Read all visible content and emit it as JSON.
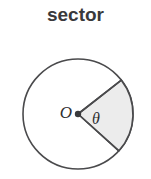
{
  "figure": {
    "title": "sector",
    "type": "geometry-diagram",
    "background_color": "#ffffff",
    "title_color": "#39393b"
  },
  "circle": {
    "center_label": "O",
    "center_x": 78,
    "center_y": 114,
    "radius": 55,
    "stroke_color": "#4a4a4c",
    "stroke_width": 1.6,
    "fill_color": "#ffffff"
  },
  "center_point": {
    "name": "vertex-dot",
    "x": 78,
    "y": 114,
    "radius": 3.2,
    "color": "#3a3a3c"
  },
  "sector": {
    "angle_label": "θ",
    "start_angle_deg": -38,
    "end_angle_deg": 42,
    "fill_color": "#ececec",
    "stroke_color": "#4a4a4c",
    "stroke_width": 1.6
  },
  "labels": {
    "center": {
      "text": "O",
      "x": 66,
      "y": 114,
      "font_size": 17
    },
    "angle": {
      "text": "θ",
      "x": 96,
      "y": 120,
      "font_size": 16
    }
  }
}
